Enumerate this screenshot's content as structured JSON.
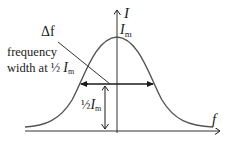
{
  "diagram": {
    "type": "resonance-curve",
    "axes": {
      "y_label": "I",
      "x_label": "f"
    },
    "peak_label": {
      "symbol": "I",
      "subscript": "m"
    },
    "annotations": {
      "delta_f": "Δf",
      "line1": "frequency",
      "line2_prefix": "width at ½ ",
      "line2_symbol": "I",
      "line2_subscript": "m",
      "half_prefix": "½",
      "half_symbol": "I",
      "half_subscript": "m"
    },
    "colors": {
      "axis": "#2a2a2a",
      "curve": "#555555",
      "text": "#1a1a1a"
    }
  }
}
